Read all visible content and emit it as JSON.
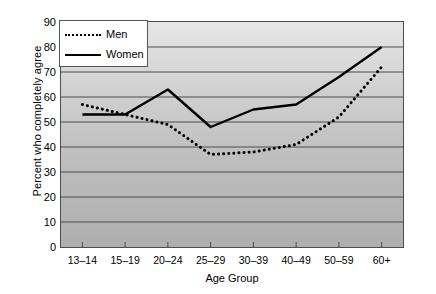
{
  "chart_data": {
    "type": "line",
    "title": "",
    "xlabel": "Age Group",
    "ylabel": "Percent who completely agree",
    "categories": [
      "13–14",
      "15–19",
      "20–24",
      "25–29",
      "30–39",
      "40–49",
      "50–59",
      "60+"
    ],
    "series": [
      {
        "name": "Men",
        "style": "dotted",
        "color": "#000000",
        "values": [
          57,
          53,
          49,
          37,
          38,
          41,
          52,
          72
        ]
      },
      {
        "name": "Women",
        "style": "solid",
        "color": "#000000",
        "values": [
          53,
          53,
          63,
          48,
          55,
          57,
          68,
          80
        ]
      }
    ],
    "ylim": [
      0,
      90
    ],
    "yticks": [
      0,
      10,
      20,
      30,
      40,
      50,
      60,
      70,
      80,
      90
    ],
    "ytick_labels": [
      "0",
      "10",
      "20",
      "30",
      "40",
      "50",
      "60",
      "70",
      "80",
      "90"
    ],
    "grid": "horizontal",
    "legend_position": "top-left",
    "legend_entries": [
      "Men",
      "Women"
    ],
    "plot_background": "#cccccc",
    "gridline_color": "#4d4d4d",
    "frame_color": "#4d4d4d"
  }
}
